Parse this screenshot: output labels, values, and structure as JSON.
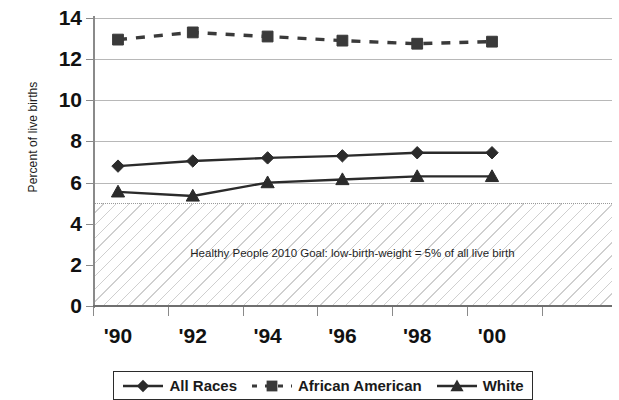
{
  "chart_data": {
    "type": "line",
    "title": "",
    "xlabel": "",
    "ylabel": "Percent of live births",
    "x": [
      1990,
      1992,
      1994,
      1996,
      1998,
      2000
    ],
    "categories": [
      "'90",
      "'92",
      "'94",
      "'96",
      "'98",
      "'00"
    ],
    "xtick_labels": [
      "'90",
      "'92",
      "'94",
      "'96",
      "'98",
      "'00"
    ],
    "ytick_labels": [
      "0",
      "2",
      "4",
      "6",
      "8",
      "10",
      "12",
      "14"
    ],
    "ytick_values": [
      0,
      2,
      4,
      6,
      8,
      10,
      12,
      14
    ],
    "ylim": [
      0,
      14
    ],
    "grid": "horizontal",
    "legend_position": "bottom",
    "series": [
      {
        "name": "All Races",
        "marker": "diamond",
        "line_style": "solid",
        "color": "#2b2b2b",
        "values": [
          6.8,
          7.05,
          7.2,
          7.3,
          7.45,
          7.45
        ]
      },
      {
        "name": "African American",
        "marker": "square",
        "line_style": "dashed",
        "color": "#3a3a3a",
        "values": [
          12.95,
          13.3,
          13.1,
          12.9,
          12.75,
          12.85
        ]
      },
      {
        "name": "White",
        "marker": "triangle",
        "line_style": "solid",
        "color": "#2b2b2b",
        "values": [
          5.55,
          5.35,
          6.0,
          6.15,
          6.3,
          6.3
        ]
      }
    ],
    "annotations": [
      {
        "name": "goal-band",
        "text": "Healthy People 2010 Goal: low-birth-weight = 5% of all live birth",
        "band_from": 0,
        "band_to": 5,
        "fill": "diagonal-hatch"
      }
    ]
  },
  "axis": {
    "y_title": "Percent of live births"
  },
  "goal": {
    "text": "Healthy People 2010 Goal: low-birth-weight = 5% of all live birth"
  },
  "legend": {
    "entries": [
      {
        "label": "All Races",
        "marker": "diamond-marker",
        "style": "solid"
      },
      {
        "label": "African American",
        "marker": "square-marker",
        "style": "dashed"
      },
      {
        "label": "White",
        "marker": "triangle-marker",
        "style": "solid"
      }
    ]
  }
}
